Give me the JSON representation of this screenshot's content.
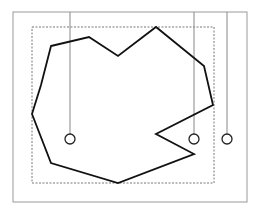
{
  "diagram": {
    "type": "point-in-polygon-ray-casting",
    "outer_frame": {
      "x": 13,
      "y": 12,
      "width": 234,
      "height": 190,
      "stroke": "#999999"
    },
    "bounding_box": {
      "x": 32,
      "y": 27,
      "width": 182,
      "height": 156,
      "stroke": "#555555",
      "dashed": true
    },
    "polygon": {
      "stroke": "#111111",
      "points": [
        [
          51,
          46
        ],
        [
          89,
          37
        ],
        [
          118,
          56
        ],
        [
          156,
          27
        ],
        [
          204,
          66
        ],
        [
          213,
          105
        ],
        [
          156,
          134
        ],
        [
          194,
          154
        ],
        [
          118,
          183
        ],
        [
          51,
          163
        ],
        [
          32,
          114
        ],
        [
          41,
          85
        ]
      ]
    },
    "test_points": [
      {
        "label": "p1",
        "cx": 70,
        "cy": 139,
        "r": 5,
        "ray_top": 12
      },
      {
        "label": "p2",
        "cx": 194,
        "cy": 139,
        "r": 5,
        "ray_top": 12
      },
      {
        "label": "p3",
        "cx": 227,
        "cy": 139,
        "r": 5,
        "ray_top": 12
      }
    ],
    "ray_stroke": "#888888"
  }
}
